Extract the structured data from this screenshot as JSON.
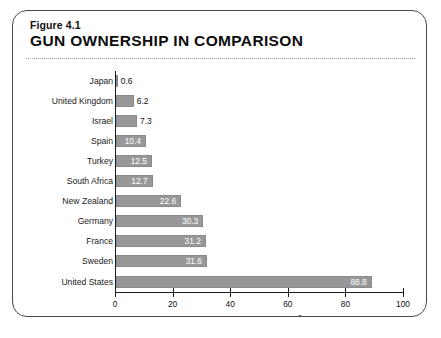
{
  "figure": {
    "number": "Figure 4.1",
    "title": "GUN OWNERSHIP IN COMPARISON"
  },
  "chart_data": {
    "type": "bar",
    "orientation": "horizontal",
    "title": "GUN OWNERSHIP IN COMPARISON",
    "subtitle": "Figure 4.1",
    "xlabel": "Guns per 100 people",
    "ylabel": "",
    "xlim": [
      0,
      100
    ],
    "xticks": [
      0,
      20,
      40,
      60,
      80,
      100
    ],
    "xtick_labels": [
      "0",
      "20",
      "40",
      "60",
      "80",
      "100"
    ],
    "grid": false,
    "legend": false,
    "bar_color": "#989898",
    "categories": [
      "Japan",
      "United Kingdom",
      "Israel",
      "Spain",
      "Turkey",
      "South Africa",
      "New Zealand",
      "Germany",
      "France",
      "Sweden",
      "United States"
    ],
    "values": [
      0.6,
      6.2,
      7.3,
      10.4,
      12.5,
      12.7,
      22.6,
      30.3,
      31.2,
      31.6,
      88.8
    ],
    "value_labels": [
      "0.6",
      "6.2",
      "7.3",
      "10.4",
      "12.5",
      "12.7",
      "22.6",
      "30.3",
      "31.2",
      "31.6",
      "88.8"
    ]
  }
}
